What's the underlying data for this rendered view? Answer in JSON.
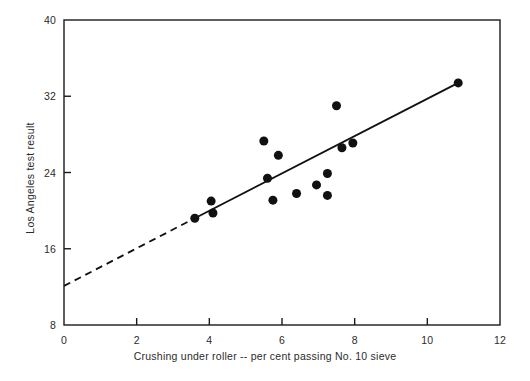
{
  "chart_data": {
    "type": "scatter",
    "title": "",
    "xlabel": "Crushing under roller -- per cent passing No. 10 sieve",
    "ylabel": "Los Angeles test result",
    "xlim": [
      0,
      12
    ],
    "ylim": [
      8,
      40
    ],
    "xticks": [
      0,
      2,
      4,
      6,
      8,
      10,
      12
    ],
    "yticks": [
      8,
      16,
      24,
      32,
      40
    ],
    "xtick_labels": [
      "0",
      "2",
      "4",
      "6",
      "8",
      "10",
      "12"
    ],
    "ytick_labels": [
      "8",
      "16",
      "24",
      "32",
      "40"
    ],
    "grid": false,
    "legend": null,
    "marker": {
      "shape": "circle",
      "color": "#111111",
      "size_px": 9
    },
    "points": [
      {
        "x": 3.6,
        "y": 19.2
      },
      {
        "x": 4.05,
        "y": 21.0
      },
      {
        "x": 4.1,
        "y": 19.75
      },
      {
        "x": 5.5,
        "y": 27.3
      },
      {
        "x": 5.6,
        "y": 23.4
      },
      {
        "x": 5.75,
        "y": 21.1
      },
      {
        "x": 5.9,
        "y": 25.8
      },
      {
        "x": 6.4,
        "y": 21.8
      },
      {
        "x": 6.95,
        "y": 22.7
      },
      {
        "x": 7.25,
        "y": 23.9
      },
      {
        "x": 7.25,
        "y": 21.6
      },
      {
        "x": 7.5,
        "y": 31.0
      },
      {
        "x": 7.65,
        "y": 26.6
      },
      {
        "x": 7.95,
        "y": 27.1
      },
      {
        "x": 10.85,
        "y": 33.4
      }
    ],
    "fit_line": {
      "style_solid": "solid",
      "style_extrapolated": "dashed",
      "color": "#111111",
      "solid_from": {
        "x": 3.6,
        "y": 19.2
      },
      "solid_to": {
        "x": 10.85,
        "y": 33.4
      },
      "dashed_from": {
        "x": 0.0,
        "y": 12.1
      },
      "dashed_to": {
        "x": 3.6,
        "y": 19.2
      }
    },
    "axis_color": "#1a1a1a",
    "background": "#ffffff"
  }
}
